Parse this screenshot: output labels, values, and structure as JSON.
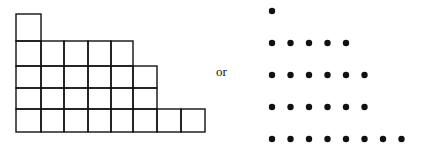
{
  "diagram": {
    "row_lengths": [
      1,
      5,
      6,
      6,
      8
    ],
    "connector_text": "or",
    "grid": {
      "x_lines": [
        16,
        41,
        64,
        88,
        111,
        133,
        157,
        181,
        205
      ],
      "y_lines": [
        14,
        41,
        66,
        88,
        109,
        132
      ],
      "stroke": "#111111",
      "stroke_width": 1.4
    },
    "dots": {
      "origin_x": 272,
      "row_y": [
        11,
        43,
        75,
        107,
        139
      ],
      "spacing_x": 18.5,
      "radius": 3.2,
      "fill": "#111111"
    }
  }
}
